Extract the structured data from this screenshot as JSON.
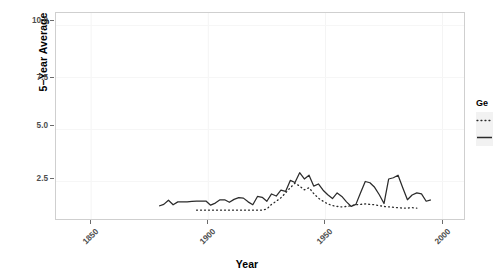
{
  "chart_data": {
    "type": "line",
    "title": "",
    "xlabel": "Year",
    "ylabel": "5-Year Average",
    "xlim": [
      1835,
      2010
    ],
    "ylim": [
      0.6,
      10.6
    ],
    "grid": true,
    "legend_position": "right",
    "legend_title": "Ge",
    "xticks": [
      1850,
      1900,
      1950,
      2000
    ],
    "yticks": [
      2.5,
      5.0,
      7.5,
      10.0
    ],
    "ytick_labels": [
      "2.5",
      "5.0",
      "7.5",
      "10.0"
    ],
    "xtick_labels": [
      "1850",
      "1900",
      "1950",
      "2000"
    ],
    "series": [
      {
        "name": "series-solid",
        "linestyle": "solid",
        "color": "#2b2b2b",
        "x": [
          1879,
          1881,
          1883,
          1885,
          1887,
          1889,
          1891,
          1893,
          1895,
          1897,
          1899,
          1901,
          1903,
          1905,
          1907,
          1909,
          1911,
          1913,
          1915,
          1917,
          1919,
          1921,
          1923,
          1925,
          1927,
          1929,
          1931,
          1933,
          1935,
          1937,
          1939,
          1941,
          1943,
          1945,
          1947,
          1949,
          1951,
          1953,
          1955,
          1957,
          1959,
          1961,
          1963,
          1965,
          1967,
          1969,
          1971,
          1973,
          1975,
          1977,
          1979,
          1981,
          1983,
          1985,
          1987,
          1989,
          1991,
          1993,
          1995
        ],
        "values": [
          1.32,
          1.4,
          1.6,
          1.38,
          1.52,
          1.52,
          1.52,
          1.54,
          1.55,
          1.56,
          1.56,
          1.36,
          1.46,
          1.62,
          1.62,
          1.5,
          1.64,
          1.72,
          1.7,
          1.52,
          1.38,
          1.78,
          1.74,
          1.55,
          1.9,
          1.8,
          2.08,
          2.02,
          2.55,
          2.45,
          2.92,
          2.62,
          2.8,
          2.28,
          2.38,
          2.08,
          1.86,
          1.68,
          1.95,
          1.78,
          1.52,
          1.3,
          1.4,
          1.96,
          2.5,
          2.44,
          2.22,
          1.86,
          1.44,
          2.62,
          2.68,
          2.8,
          2.2,
          1.62,
          1.85,
          1.95,
          1.9,
          1.55,
          1.62
        ]
      },
      {
        "name": "series-dotted",
        "linestyle": "dotted",
        "color": "#2b2b2b",
        "x": [
          1895,
          1897,
          1899,
          1901,
          1903,
          1905,
          1907,
          1909,
          1911,
          1913,
          1915,
          1917,
          1919,
          1921,
          1923,
          1925,
          1927,
          1929,
          1931,
          1933,
          1935,
          1937,
          1939,
          1941,
          1943,
          1945,
          1947,
          1949,
          1951,
          1953,
          1955,
          1957,
          1959,
          1961,
          1963,
          1965,
          1967,
          1969,
          1971,
          1973,
          1975,
          1977,
          1979,
          1981,
          1983,
          1985,
          1987,
          1989
        ],
        "values": [
          1.12,
          1.12,
          1.12,
          1.12,
          1.12,
          1.12,
          1.12,
          1.12,
          1.12,
          1.12,
          1.12,
          1.12,
          1.12,
          1.12,
          1.12,
          1.18,
          1.4,
          1.55,
          1.72,
          1.95,
          2.2,
          2.42,
          2.28,
          2.1,
          2.2,
          1.92,
          1.7,
          1.55,
          1.42,
          1.34,
          1.3,
          1.28,
          1.3,
          1.34,
          1.38,
          1.4,
          1.42,
          1.4,
          1.38,
          1.34,
          1.3,
          1.28,
          1.26,
          1.24,
          1.22,
          1.22,
          1.24,
          1.22
        ]
      }
    ],
    "legend_entries": [
      {
        "label": "",
        "linestyle": "dotted"
      },
      {
        "label": "",
        "linestyle": "solid"
      }
    ]
  },
  "axis": {
    "x_title": "Year",
    "y_title": "5−Year Average"
  },
  "legend": {
    "title": "Ge"
  }
}
